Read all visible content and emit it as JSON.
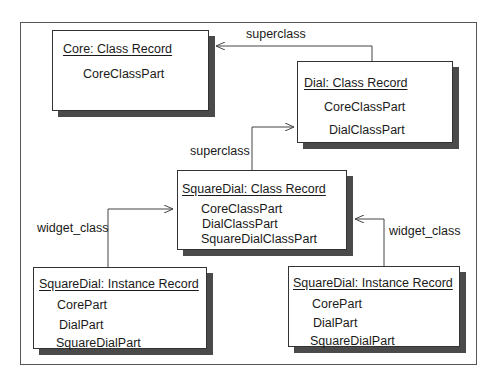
{
  "diagram": {
    "boxes": {
      "core_class": {
        "title": "Core: Class Record",
        "fields": [
          "CoreClassPart"
        ]
      },
      "dial_class": {
        "title": "Dial: Class Record",
        "fields": [
          "CoreClassPart",
          "DialClassPart"
        ]
      },
      "squaredial_class": {
        "title": "SquareDial: Class Record",
        "fields": [
          "CoreClassPart",
          "DialClassPart",
          "SquareDialClassPart"
        ]
      },
      "instance_left": {
        "title": "SquareDial: Instance Record",
        "fields": [
          "CorePart",
          "DialPart",
          "SquareDialPart"
        ]
      },
      "instance_right": {
        "title": "SquareDial: Instance Record",
        "fields": [
          "CorePart",
          "DialPart",
          "SquareDialPart"
        ]
      }
    },
    "edges": {
      "dial_to_core": "superclass",
      "squaredial_to_dial": "superclass",
      "left_instance_to_class": "widget_class",
      "right_instance_to_class": "widget_class"
    },
    "colors": {
      "line": "#444444",
      "shadow": "#4a4a4a",
      "box_border": "#333333"
    }
  }
}
